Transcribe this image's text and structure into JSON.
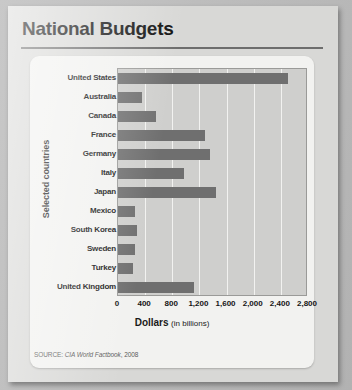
{
  "title": "National Budgets",
  "source": {
    "prefix": "SOURCE: ",
    "name": "CIA World Factbook",
    "year": ", 2008"
  },
  "colors": {
    "bar": "#6f6f6f",
    "plot_background": "#cfcfcd",
    "gridline": "#f2f2f0",
    "card": "#f2f2f0",
    "paper": "#d8d8d6",
    "text": "#151515"
  },
  "chart_data": {
    "type": "bar",
    "orientation": "horizontal",
    "title": "National Budgets",
    "xlabel": "Dollars",
    "xlabel_note": "(in billions)",
    "ylabel": "Selected countries",
    "categories": [
      "United States",
      "Australia",
      "Canada",
      "France",
      "Germany",
      "Italy",
      "Japan",
      "Mexico",
      "South Korea",
      "Sweden",
      "Turkey",
      "United Kingdom"
    ],
    "values": [
      2500,
      350,
      560,
      1280,
      1360,
      975,
      1450,
      255,
      285,
      255,
      215,
      1120
    ],
    "xlim": [
      0,
      2800
    ],
    "xticks": [
      0,
      400,
      800,
      1200,
      1600,
      2000,
      2400,
      2800
    ],
    "xtick_labels": [
      "0",
      "400",
      "800",
      "1,200",
      "1,600",
      "2,000",
      "2,400",
      "2,800"
    ],
    "grid": true,
    "grid_axis": "x",
    "legend": false
  }
}
